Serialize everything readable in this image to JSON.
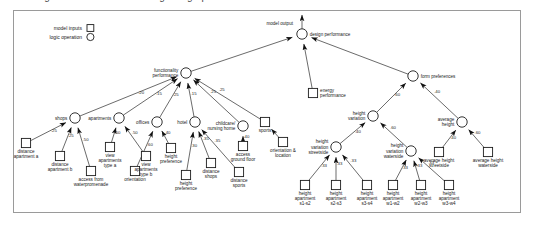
{
  "page": {
    "clipped_caption_above_frame": "logic-based model for rating design performance",
    "border_color": "#9a9a9a",
    "ink_color": "#1a1a1a"
  },
  "legend": {
    "items": [
      {
        "label": "model inputs",
        "glyph": "square"
      },
      {
        "label": "logic operation",
        "glyph": "circle"
      }
    ]
  },
  "annotations": {
    "model_output": "model output"
  },
  "chart_data": {
    "type": "diagram",
    "title": "logic-based model for rating design performance",
    "nodes": [
      {
        "id": "design_performance",
        "label": "design performance",
        "kind": "logic",
        "x": 302,
        "y": 34
      },
      {
        "id": "functionality",
        "label": "functionality\nperformance",
        "kind": "logic",
        "x": 186,
        "y": 73
      },
      {
        "id": "energy",
        "label": "energy\nperformance",
        "kind": "input",
        "x": 313,
        "y": 93
      },
      {
        "id": "form_preferences",
        "label": "form preferences",
        "kind": "logic",
        "x": 413,
        "y": 76
      },
      {
        "id": "shops",
        "label": "shops",
        "kind": "logic",
        "x": 75,
        "y": 118
      },
      {
        "id": "apartments",
        "label": "apartments",
        "kind": "logic",
        "x": 119,
        "y": 118
      },
      {
        "id": "offices",
        "label": "offices",
        "kind": "logic",
        "x": 157,
        "y": 122
      },
      {
        "id": "hotel",
        "label": "hotel",
        "kind": "logic",
        "x": 195,
        "y": 122
      },
      {
        "id": "childcare",
        "label": "childcare/\nnursing home",
        "kind": "logic",
        "x": 243,
        "y": 126
      },
      {
        "id": "sports",
        "label": "sports",
        "kind": "input",
        "x": 265,
        "y": 122
      },
      {
        "id": "height_variation",
        "label": "height\nvariation",
        "kind": "logic",
        "x": 373,
        "y": 116
      },
      {
        "id": "avg_height",
        "label": "average\nheight",
        "kind": "logic",
        "x": 462,
        "y": 122
      },
      {
        "id": "hv_streetside",
        "label": "height\nvariation\nstreetside",
        "kind": "logic",
        "x": 336,
        "y": 147
      },
      {
        "id": "hv_waterside",
        "label": "height\nvariation\nwaterside",
        "kind": "logic",
        "x": 411,
        "y": 151
      },
      {
        "id": "dist_apt_a",
        "label": "distance\napartment a",
        "kind": "input",
        "x": 26,
        "y": 143
      },
      {
        "id": "dist_apt_b",
        "label": "distance\napartment b",
        "kind": "input",
        "x": 60,
        "y": 156
      },
      {
        "id": "access_water",
        "label": "access from\nwaterpromenade",
        "kind": "input",
        "x": 91,
        "y": 171
      },
      {
        "id": "view_apt_a",
        "label": "view\napartments\ntype a",
        "kind": "input",
        "x": 110,
        "y": 147
      },
      {
        "id": "view_apt_b",
        "label": "view\napartments\ntype b",
        "kind": "input",
        "x": 146,
        "y": 156
      },
      {
        "id": "orientation",
        "label": "orientation",
        "kind": "input",
        "x": 135,
        "y": 171
      },
      {
        "id": "height_pref_1",
        "label": "height\npreference",
        "kind": "input",
        "x": 171,
        "y": 148
      },
      {
        "id": "height_pref_2",
        "label": "height\npreference",
        "kind": "input",
        "x": 186,
        "y": 175
      },
      {
        "id": "dist_shops",
        "label": "distance\nshops",
        "kind": "input",
        "x": 211,
        "y": 163
      },
      {
        "id": "dist_sports",
        "label": "distance\nsports",
        "kind": "input",
        "x": 239,
        "y": 172
      },
      {
        "id": "access_ground",
        "label": "access\nground floor",
        "kind": "input",
        "x": 243,
        "y": 146
      },
      {
        "id": "orientation_loc",
        "label": "orientation &\nlocation",
        "kind": "input",
        "x": 283,
        "y": 142
      },
      {
        "id": "h_apt_s1s2",
        "label": "height\napartment\ns1-s2",
        "kind": "input",
        "x": 305,
        "y": 185
      },
      {
        "id": "h_apt_s2s3",
        "label": "height\napartment\ns2-s3",
        "kind": "input",
        "x": 336,
        "y": 185
      },
      {
        "id": "h_apt_s3s4",
        "label": "height\napartment\ns3-s4",
        "kind": "input",
        "x": 367,
        "y": 185
      },
      {
        "id": "h_apt_w1w2",
        "label": "height\napartment\nw1-w2",
        "kind": "input",
        "x": 393,
        "y": 185
      },
      {
        "id": "h_apt_w2w3",
        "label": "height\napartment\nw2-w3",
        "kind": "input",
        "x": 421,
        "y": 185
      },
      {
        "id": "h_apt_w3w4",
        "label": "height\napartment\nw3-w4",
        "kind": "input",
        "x": 449,
        "y": 185
      },
      {
        "id": "avg_h_street",
        "label": "average height\nstreetside",
        "kind": "input",
        "x": 439,
        "y": 152
      },
      {
        "id": "avg_h_water",
        "label": "average height\nwaterside",
        "kind": "input",
        "x": 488,
        "y": 152
      }
    ],
    "edges": [
      {
        "from": "functionality",
        "to": "design_performance",
        "weight": ""
      },
      {
        "from": "energy",
        "to": "design_performance",
        "weight": ""
      },
      {
        "from": "form_preferences",
        "to": "design_performance",
        "weight": ""
      },
      {
        "from": "shops",
        "to": "functionality",
        "weight": ".20"
      },
      {
        "from": "apartments",
        "to": "functionality",
        "weight": ".15"
      },
      {
        "from": "offices",
        "to": "functionality",
        "weight": ".25"
      },
      {
        "from": "hotel",
        "to": "functionality",
        "weight": ".15"
      },
      {
        "from": "childcare",
        "to": "functionality",
        "weight": ".25"
      },
      {
        "from": "sports",
        "to": "functionality",
        "weight": ".25"
      },
      {
        "from": "dist_apt_a",
        "to": "shops",
        "weight": ".25"
      },
      {
        "from": "dist_apt_b",
        "to": "shops",
        "weight": ".25"
      },
      {
        "from": "access_water",
        "to": "shops",
        "weight": ".50"
      },
      {
        "from": "view_apt_a",
        "to": "apartments",
        "weight": ".50"
      },
      {
        "from": "view_apt_b",
        "to": "apartments",
        "weight": ".50"
      },
      {
        "from": "orientation",
        "to": "offices",
        "weight": ".60"
      },
      {
        "from": "height_pref_1",
        "to": "offices",
        "weight": ".40"
      },
      {
        "from": "height_pref_2",
        "to": "hotel",
        "weight": ".30"
      },
      {
        "from": "dist_shops",
        "to": "hotel",
        "weight": ".35"
      },
      {
        "from": "dist_sports",
        "to": "hotel",
        "weight": ".35"
      },
      {
        "from": "access_ground",
        "to": "childcare",
        "weight": ".40"
      },
      {
        "from": "orientation_loc",
        "to": "sports",
        "weight": ""
      },
      {
        "from": "height_variation",
        "to": "form_preferences",
        "weight": ".60"
      },
      {
        "from": "avg_height",
        "to": "form_preferences",
        "weight": ".40"
      },
      {
        "from": "hv_streetside",
        "to": "height_variation",
        "weight": ".40"
      },
      {
        "from": "hv_waterside",
        "to": "height_variation",
        "weight": ".60"
      },
      {
        "from": "h_apt_s1s2",
        "to": "hv_streetside",
        "weight": ".33"
      },
      {
        "from": "h_apt_s2s3",
        "to": "hv_streetside",
        "weight": ".33"
      },
      {
        "from": "h_apt_s3s4",
        "to": "hv_streetside",
        "weight": ".33"
      },
      {
        "from": "h_apt_w1w2",
        "to": "hv_waterside",
        "weight": ".33"
      },
      {
        "from": "h_apt_w2w3",
        "to": "hv_waterside",
        "weight": ".33"
      },
      {
        "from": "h_apt_w3w4",
        "to": "hv_waterside",
        "weight": ".33"
      },
      {
        "from": "avg_h_street",
        "to": "avg_height",
        "weight": ".40"
      },
      {
        "from": "avg_h_water",
        "to": "avg_height",
        "weight": ".60"
      }
    ]
  }
}
